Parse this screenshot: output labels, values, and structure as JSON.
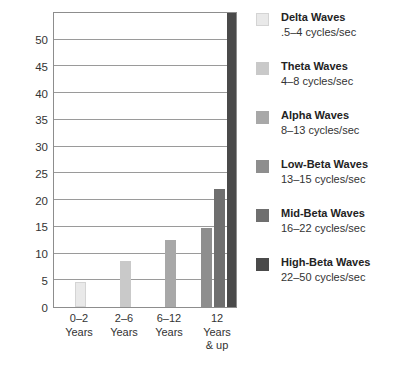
{
  "chart_data": {
    "type": "bar",
    "title": "",
    "subtitle": "",
    "xlabel": "",
    "ylabel": "",
    "categories": [
      "0–2\nYears",
      "2–6\nYears",
      "6–12\nYears",
      "12\nYears\n& up"
    ],
    "ylim": [
      0,
      55
    ],
    "ytick_labels": [
      "0",
      "5",
      "10",
      "15",
      "20",
      "25",
      "30",
      "35",
      "40",
      "45",
      "50"
    ],
    "ytick_values": [
      0,
      5,
      10,
      15,
      20,
      25,
      30,
      35,
      40,
      45,
      50
    ],
    "grid": "horizontal",
    "legend_position": "right",
    "series": [
      {
        "name": "Delta Waves",
        "color": "#e9e9e9",
        "values": [
          4.7,
          null,
          null,
          null
        ]
      },
      {
        "name": "Theta Waves",
        "color": "#c9c9c9",
        "values": [
          null,
          8.7,
          null,
          null
        ]
      },
      {
        "name": "Alpha Waves",
        "color": "#a8a8a8",
        "values": [
          null,
          null,
          12.5,
          null
        ]
      },
      {
        "name": "Low-Beta Waves",
        "color": "#8e8e8e",
        "values": [
          null,
          null,
          null,
          14.8
        ]
      },
      {
        "name": "Mid-Beta Waves",
        "color": "#6f6f6f",
        "values": [
          null,
          null,
          null,
          22.0
        ]
      },
      {
        "name": "High-Beta Waves",
        "color": "#4a4a4a",
        "values": [
          null,
          null,
          null,
          55.0
        ]
      }
    ],
    "bars": [
      {
        "label": "Delta Waves",
        "group": "0–2 Years",
        "value": 4.7,
        "color": "#e9e9e9"
      },
      {
        "label": "Theta Waves",
        "group": "2–6 Years",
        "value": 8.7,
        "color": "#c9c9c9"
      },
      {
        "label": "Alpha Waves",
        "group": "6–12 Years",
        "value": 12.5,
        "color": "#a8a8a8"
      },
      {
        "label": "Low-Beta Waves",
        "group": "12 Years & up",
        "value": 14.8,
        "color": "#8e8e8e"
      },
      {
        "label": "Mid-Beta Waves",
        "group": "12 Years & up",
        "value": 22.0,
        "color": "#6f6f6f"
      },
      {
        "label": "High-Beta Waves",
        "group": "12 Years & up",
        "value": 55.0,
        "color": "#4a4a4a"
      }
    ]
  },
  "yaxis": {
    "ticks": [
      {
        "label": "50",
        "value": 50
      },
      {
        "label": "45",
        "value": 45
      },
      {
        "label": "40",
        "value": 40
      },
      {
        "label": "35",
        "value": 35
      },
      {
        "label": "30",
        "value": 30
      },
      {
        "label": "25",
        "value": 25
      },
      {
        "label": "20",
        "value": 20
      },
      {
        "label": "15",
        "value": 15
      },
      {
        "label": "10",
        "value": 10
      },
      {
        "label": "5",
        "value": 5
      },
      {
        "label": "0",
        "value": 0
      }
    ]
  },
  "xaxis": {
    "ticks": [
      {
        "label": "0–2\nYears"
      },
      {
        "label": "2–6\nYears"
      },
      {
        "label": "6–12\nYears"
      },
      {
        "label": "12\nYears\n& up"
      }
    ]
  },
  "legend": {
    "items": [
      {
        "title": "Delta Waves",
        "sub": ".5–4 cycles/sec",
        "color": "#e9e9e9"
      },
      {
        "title": "Theta Waves",
        "sub": "4–8 cycles/sec",
        "color": "#c9c9c9"
      },
      {
        "title": "Alpha Waves",
        "sub": "8–13 cycles/sec",
        "color": "#a8a8a8"
      },
      {
        "title": "Low-Beta Waves",
        "sub": "13–15 cycles/sec",
        "color": "#8e8e8e"
      },
      {
        "title": "Mid-Beta Waves",
        "sub": "16–22 cycles/sec",
        "color": "#6f6f6f"
      },
      {
        "title": "High-Beta Waves",
        "sub": "22–50 cycles/sec",
        "color": "#4a4a4a"
      }
    ]
  },
  "style": {
    "frame_color": "#8d8d8d",
    "grid_color": "#9a9a9a",
    "text_color": "#333333",
    "background": "#ffffff"
  }
}
